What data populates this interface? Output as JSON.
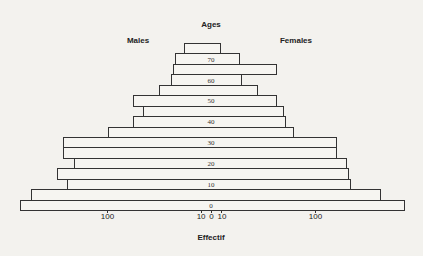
{
  "chart_data": {
    "type": "bar",
    "subtype": "population-pyramid",
    "title": "",
    "ylabel": "Ages",
    "xlabel": "Effectif",
    "left_label": "Males",
    "right_label": "Females",
    "age_tick_labels": [
      "70",
      "60",
      "50",
      "40",
      "30",
      "20",
      "10",
      "0"
    ],
    "x_tick_labels": [
      "100",
      "10",
      "0",
      "10",
      "100"
    ],
    "x_ticks": [
      -100,
      -10,
      0,
      10,
      100
    ],
    "grid": false,
    "categories": [
      "75-80",
      "70-75",
      "65-70",
      "60-65",
      "55-60",
      "50-55",
      "45-50",
      "40-45",
      "35-40",
      "30-35",
      "25-30",
      "20-25",
      "15-20",
      "10-15",
      "5-10",
      "0-5"
    ],
    "series": [
      {
        "name": "Males",
        "values": [
          26,
          35,
          37,
          38,
          50,
          75,
          65,
          75,
          99,
          142,
          142,
          132,
          148,
          138,
          173,
          184
        ]
      },
      {
        "name": "Females",
        "values": [
          10,
          28,
          63,
          30,
          45,
          63,
          70,
          72,
          80,
          121,
          121,
          131,
          133,
          135,
          163,
          187
        ]
      }
    ]
  },
  "labels": {
    "ages": "Ages",
    "males": "Males",
    "females": "Females",
    "effectif": "Effectif"
  }
}
